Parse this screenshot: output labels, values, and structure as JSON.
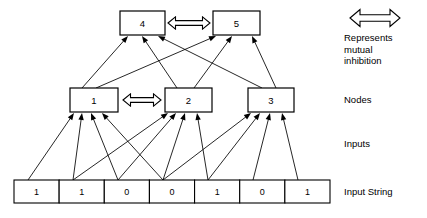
{
  "diagram": {
    "canvas": {
      "width": 427,
      "height": 218
    },
    "top_nodes": [
      {
        "id": "node-4",
        "label": "4",
        "x": 120,
        "y": 11,
        "w": 45,
        "h": 24
      },
      {
        "id": "node-5",
        "label": "5",
        "x": 213,
        "y": 11,
        "w": 47,
        "h": 24
      }
    ],
    "middle_nodes": [
      {
        "id": "node-1",
        "label": "1",
        "x": 70,
        "y": 88,
        "w": 48,
        "h": 24
      },
      {
        "id": "node-2",
        "label": "2",
        "x": 165,
        "y": 88,
        "w": 47,
        "h": 24
      },
      {
        "id": "node-3",
        "label": "3",
        "x": 248,
        "y": 88,
        "w": 46,
        "h": 24
      }
    ],
    "input_string": {
      "x": 14,
      "y": 180,
      "w": 316,
      "h": 23,
      "values": [
        "1",
        "1",
        "0",
        "0",
        "1",
        "0",
        "1"
      ]
    },
    "inhibition_links": [
      {
        "id": "inhibition-4-5",
        "from": "node-4",
        "to": "node-5",
        "x1": 168,
        "x2": 210,
        "y": 23
      },
      {
        "id": "inhibition-1-2",
        "from": "node-1",
        "to": "node-2",
        "x1": 123,
        "x2": 161,
        "y": 100
      }
    ],
    "node_to_top_edges": [
      {
        "from": "node-1",
        "to": "node-4",
        "fx": 82,
        "fy": 88,
        "tx": 128,
        "ty": 36
      },
      {
        "from": "node-2",
        "to": "node-4",
        "fx": 177,
        "fy": 88,
        "tx": 142,
        "ty": 36
      },
      {
        "from": "node-3",
        "to": "node-4",
        "fx": 262,
        "fy": 88,
        "tx": 158,
        "ty": 36
      },
      {
        "from": "node-1",
        "to": "node-5",
        "fx": 96,
        "fy": 88,
        "tx": 216,
        "ty": 36
      },
      {
        "from": "node-2",
        "to": "node-5",
        "fx": 194,
        "fy": 88,
        "tx": 232,
        "ty": 36
      },
      {
        "from": "node-3",
        "to": "node-5",
        "fx": 276,
        "fy": 88,
        "tx": 252,
        "ty": 36
      }
    ],
    "input_to_node_edges": [
      {
        "from_cell": 0,
        "to": "node-1",
        "fx": 28,
        "fy": 180,
        "tx": 74,
        "ty": 113
      },
      {
        "from_cell": 1,
        "to": "node-1",
        "fx": 73,
        "fy": 180,
        "tx": 82,
        "ty": 113
      },
      {
        "from_cell": 2,
        "to": "node-1",
        "fx": 118,
        "fy": 180,
        "tx": 91,
        "ty": 113
      },
      {
        "from_cell": 3,
        "to": "node-1",
        "fx": 163,
        "fy": 180,
        "tx": 102,
        "ty": 113
      },
      {
        "from_cell": 1,
        "to": "node-2",
        "fx": 73,
        "fy": 180,
        "tx": 168,
        "ty": 113
      },
      {
        "from_cell": 2,
        "to": "node-2",
        "fx": 118,
        "fy": 180,
        "tx": 176,
        "ty": 113
      },
      {
        "from_cell": 3,
        "to": "node-2",
        "fx": 163,
        "fy": 180,
        "tx": 185,
        "ty": 113
      },
      {
        "from_cell": 4,
        "to": "node-2",
        "fx": 208,
        "fy": 180,
        "tx": 197,
        "ty": 113
      },
      {
        "from_cell": 3,
        "to": "node-3",
        "fx": 163,
        "fy": 180,
        "tx": 251,
        "ty": 113
      },
      {
        "from_cell": 4,
        "to": "node-3",
        "fx": 208,
        "fy": 180,
        "tx": 260,
        "ty": 113
      },
      {
        "from_cell": 5,
        "to": "node-3",
        "fx": 253,
        "fy": 180,
        "tx": 270,
        "ty": 113
      },
      {
        "from_cell": 6,
        "to": "node-3",
        "fx": 298,
        "fy": 180,
        "tx": 282,
        "ty": 113
      }
    ]
  },
  "legend": {
    "inhibition_caption_line1": "Represents",
    "inhibition_caption_line2": "mutual",
    "inhibition_caption_line3": "inhibition",
    "nodes_label": "Nodes",
    "inputs_label": "Inputs",
    "input_string_label": "Input String"
  }
}
